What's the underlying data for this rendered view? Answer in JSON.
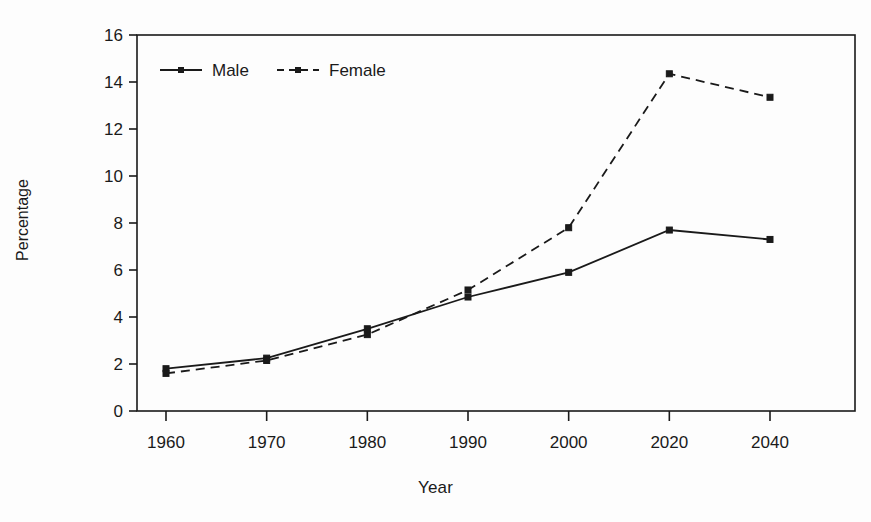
{
  "chart_data": {
    "type": "line",
    "title": "",
    "xlabel": "Year",
    "ylabel": "Percentage",
    "categories": [
      "1960",
      "1970",
      "1980",
      "1990",
      "2000",
      "2020",
      "2040"
    ],
    "ylim": [
      0,
      16
    ],
    "yticks": [
      "0",
      "2",
      "4",
      "6",
      "8",
      "10",
      "12",
      "14",
      "16"
    ],
    "grid": false,
    "legend_position": "top-left-inside",
    "series": [
      {
        "name": "Male",
        "style": "solid",
        "marker": "square",
        "color": "#1a1a1a",
        "values": [
          1.8,
          2.25,
          3.5,
          4.85,
          5.9,
          7.7,
          7.3
        ]
      },
      {
        "name": "Female",
        "style": "dashed",
        "marker": "square",
        "color": "#1a1a1a",
        "values": [
          1.6,
          2.15,
          3.25,
          5.15,
          7.8,
          14.35,
          13.35
        ]
      }
    ]
  },
  "legend": {
    "male_label": "Male",
    "female_label": "Female"
  },
  "axes": {
    "x_title": "Year",
    "y_title": "Percentage"
  }
}
